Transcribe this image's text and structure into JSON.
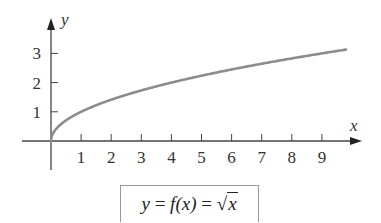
{
  "chart_data": {
    "type": "line",
    "title": "",
    "xlabel": "x",
    "ylabel": "y",
    "function": "y = sqrt(x)",
    "x_ticks": [
      1,
      2,
      3,
      4,
      5,
      6,
      7,
      8,
      9
    ],
    "y_ticks": [
      1,
      2,
      3
    ],
    "xlim": [
      0,
      9.8
    ],
    "ylim": [
      0,
      3.6
    ],
    "grid": false,
    "legend": null,
    "series": [
      {
        "name": "y = f(x) = √x",
        "x": [
          0,
          0.25,
          0.5,
          1,
          2,
          3,
          4,
          5,
          6,
          7,
          8,
          9,
          9.8
        ],
        "values": [
          0,
          0.5,
          0.71,
          1,
          1.41,
          1.73,
          2,
          2.24,
          2.45,
          2.65,
          2.83,
          3,
          3.13
        ],
        "color": "#8c8c8c"
      }
    ],
    "annotation": "y = f(x) = √x"
  },
  "axes": {
    "x_label": "x",
    "y_label": "y",
    "x_tick_labels": [
      "1",
      "2",
      "3",
      "4",
      "5",
      "6",
      "7",
      "8",
      "9"
    ],
    "y_tick_labels": [
      "1",
      "2",
      "3"
    ]
  },
  "caption": {
    "lhs": "y",
    "eq1": " = ",
    "f": "f",
    "arg": "(x)",
    "eq2": " = ",
    "radicand": "x"
  }
}
